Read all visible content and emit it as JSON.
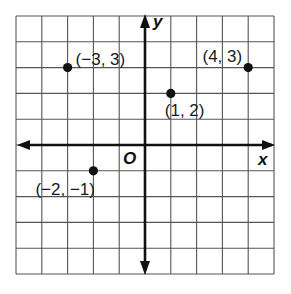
{
  "chart_data": {
    "type": "scatter",
    "title": "",
    "xlabel": "x",
    "ylabel": "y",
    "origin_label": "O",
    "xlim": [
      -5,
      5
    ],
    "ylim": [
      -5,
      5
    ],
    "grid": true,
    "grid_step": 1,
    "tick_labels": false,
    "points": [
      {
        "x": -3,
        "y": 3,
        "label": "(−3, 3)"
      },
      {
        "x": 4,
        "y": 3,
        "label": "(4, 3)"
      },
      {
        "x": 1,
        "y": 2,
        "label": "(1, 2)"
      },
      {
        "x": -2,
        "y": -1,
        "label": "(−2, −1)"
      }
    ]
  },
  "colors": {
    "grid": "#555555",
    "axis": "#111111",
    "point": "#111111",
    "background": "#ffffff"
  }
}
